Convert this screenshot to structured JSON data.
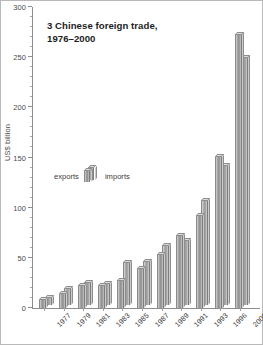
{
  "chart_data": {
    "type": "bar",
    "title": "3 Chinese foreign trade,\n1976–2000",
    "title_line1": "3 Chinese foreign trade,",
    "title_line2": "1976–2000",
    "xlabel": "",
    "ylabel": "US$ billion",
    "ylim": [
      0,
      300
    ],
    "ytick_values": [
      0,
      50,
      100,
      150,
      200,
      250,
      300
    ],
    "ytick_labels": [
      "0",
      "50",
      "100",
      "150",
      "200",
      "250",
      "300"
    ],
    "minor_tick_step": 10,
    "grid": false,
    "legend_position": "center-left",
    "categories": [
      "1977",
      "1979",
      "1981",
      "1983",
      "1985",
      "1987",
      "1989",
      "1991",
      "1993",
      "1996",
      "2000"
    ],
    "series": [
      {
        "name": "exports",
        "color": "#9f9f9f",
        "values": [
          8,
          14,
          22,
          22,
          27,
          39,
          53,
          72,
          92,
          151,
          273
        ]
      },
      {
        "name": "imports",
        "color": "#aeaeae",
        "values": [
          7,
          16,
          22,
          21,
          42,
          43,
          59,
          64,
          104,
          139,
          247
        ]
      }
    ],
    "legend": [
      "exports",
      "imports"
    ],
    "units": "US$ billion"
  }
}
